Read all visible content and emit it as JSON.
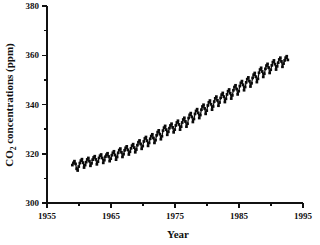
{
  "chart_data": {
    "type": "line",
    "title": "",
    "xlabel": "Year",
    "ylabel": "CO2 concentrations (ppm)",
    "ylabel_display": "CO₂ concentrations (ppm)",
    "xlim": [
      1955,
      1995
    ],
    "ylim": [
      300,
      380
    ],
    "grid": false,
    "legend": "none",
    "xticks": [
      1955,
      1965,
      1975,
      1985,
      1995
    ],
    "xticks_minor": [
      1960,
      1970,
      1980,
      1990
    ],
    "xtick_labels": [
      "1955",
      "1965",
      "1975",
      "1985",
      "1995"
    ],
    "yticks": [
      300,
      320,
      340,
      360,
      380
    ],
    "yticks_minor": [
      310,
      330,
      350,
      370
    ],
    "ytick_labels": [
      "300",
      "320",
      "340",
      "360",
      "380"
    ],
    "marker": "filled-square",
    "series": [
      {
        "name": "Mauna Loa monthly mean CO2",
        "x": [
          1958.96,
          1959.13,
          1959.29,
          1959.46,
          1959.63,
          1959.79,
          1959.96,
          1960.13,
          1960.29,
          1960.46,
          1960.63,
          1960.79,
          1960.96,
          1961.13,
          1961.29,
          1961.46,
          1961.63,
          1961.79,
          1961.96,
          1962.13,
          1962.29,
          1962.46,
          1962.63,
          1962.79,
          1962.96,
          1963.13,
          1963.29,
          1963.46,
          1963.63,
          1963.79,
          1963.96,
          1964.13,
          1964.29,
          1964.46,
          1964.63,
          1964.79,
          1964.96,
          1965.13,
          1965.29,
          1965.46,
          1965.63,
          1965.79,
          1965.96,
          1966.13,
          1966.29,
          1966.46,
          1966.63,
          1966.79,
          1966.96,
          1967.13,
          1967.29,
          1967.46,
          1967.63,
          1967.79,
          1967.96,
          1968.13,
          1968.29,
          1968.46,
          1968.63,
          1968.79,
          1968.96,
          1969.13,
          1969.29,
          1969.46,
          1969.63,
          1969.79,
          1969.96,
          1970.13,
          1970.29,
          1970.46,
          1970.63,
          1970.79,
          1970.96,
          1971.13,
          1971.29,
          1971.46,
          1971.63,
          1971.79,
          1971.96,
          1972.13,
          1972.29,
          1972.46,
          1972.63,
          1972.79,
          1972.96,
          1973.13,
          1973.29,
          1973.46,
          1973.63,
          1973.79,
          1973.96,
          1974.13,
          1974.29,
          1974.46,
          1974.63,
          1974.79,
          1974.96,
          1975.13,
          1975.29,
          1975.46,
          1975.63,
          1975.79,
          1975.96,
          1976.13,
          1976.29,
          1976.46,
          1976.63,
          1976.79,
          1976.96,
          1977.13,
          1977.29,
          1977.46,
          1977.63,
          1977.79,
          1977.96,
          1978.13,
          1978.29,
          1978.46,
          1978.63,
          1978.79,
          1978.96,
          1979.13,
          1979.29,
          1979.46,
          1979.63,
          1979.79,
          1979.96,
          1980.13,
          1980.29,
          1980.46,
          1980.63,
          1980.79,
          1980.96,
          1981.13,
          1981.29,
          1981.46,
          1981.63,
          1981.79,
          1981.96,
          1982.13,
          1982.29,
          1982.46,
          1982.63,
          1982.79,
          1982.96,
          1983.13,
          1983.29,
          1983.46,
          1983.63,
          1983.79,
          1983.96,
          1984.13,
          1984.29,
          1984.46,
          1984.63,
          1984.79,
          1984.96,
          1985.13,
          1985.29,
          1985.46,
          1985.63,
          1985.79,
          1985.96,
          1986.13,
          1986.29,
          1986.46,
          1986.63,
          1986.79,
          1986.96,
          1987.13,
          1987.29,
          1987.46,
          1987.63,
          1987.79,
          1987.96,
          1988.13,
          1988.29,
          1988.46,
          1988.63,
          1988.79,
          1988.96,
          1989.13,
          1989.29,
          1989.46,
          1989.63,
          1989.79,
          1989.96,
          1990.13,
          1990.29,
          1990.46,
          1990.63,
          1990.79,
          1990.96,
          1991.13,
          1991.29,
          1991.46,
          1991.63,
          1991.79,
          1991.96,
          1992.13,
          1992.29,
          1992.46,
          1992.63
        ],
        "y": [
          315.4,
          316.3,
          317.0,
          315.9,
          313.9,
          313.2,
          314.8,
          316.2,
          317.2,
          317.8,
          316.4,
          314.4,
          315.4,
          316.6,
          317.7,
          318.3,
          317.0,
          315.1,
          316.1,
          317.6,
          318.5,
          319.0,
          317.7,
          315.7,
          316.8,
          318.3,
          319.2,
          319.7,
          318.3,
          316.3,
          317.4,
          318.8,
          319.6,
          320.2,
          318.9,
          317.0,
          318.0,
          319.4,
          320.4,
          321.0,
          319.5,
          317.6,
          318.7,
          320.4,
          321.5,
          322.1,
          320.6,
          318.7,
          319.8,
          321.4,
          322.4,
          323.0,
          321.6,
          319.7,
          320.8,
          322.2,
          323.3,
          323.9,
          322.5,
          320.6,
          321.7,
          323.5,
          324.7,
          325.4,
          324.0,
          322.0,
          323.1,
          325.0,
          326.2,
          326.8,
          325.3,
          323.2,
          324.4,
          326.1,
          327.2,
          327.9,
          326.4,
          324.4,
          325.5,
          327.5,
          328.8,
          329.5,
          328.0,
          325.9,
          327.1,
          329.4,
          330.6,
          331.3,
          329.8,
          327.7,
          328.9,
          330.4,
          331.5,
          332.2,
          330.7,
          328.7,
          329.8,
          331.5,
          332.7,
          333.4,
          331.9,
          329.8,
          331.0,
          332.7,
          333.9,
          334.6,
          333.1,
          331.0,
          332.2,
          334.5,
          335.8,
          336.5,
          335.0,
          332.9,
          334.1,
          336.2,
          337.4,
          338.1,
          336.6,
          334.5,
          335.7,
          337.9,
          339.2,
          339.9,
          338.4,
          336.2,
          337.5,
          339.6,
          340.9,
          341.6,
          340.1,
          337.9,
          339.2,
          341.2,
          342.5,
          343.2,
          341.7,
          339.5,
          340.8,
          342.7,
          344.0,
          344.7,
          343.2,
          341.0,
          342.3,
          344.1,
          345.4,
          346.1,
          344.6,
          342.4,
          343.7,
          345.8,
          347.1,
          347.8,
          346.3,
          344.1,
          345.4,
          347.5,
          348.8,
          349.5,
          348.0,
          345.8,
          347.1,
          349.0,
          350.3,
          351.0,
          349.5,
          347.3,
          348.6,
          350.8,
          352.1,
          352.8,
          351.3,
          349.1,
          350.4,
          352.9,
          354.2,
          354.9,
          353.4,
          351.2,
          352.5,
          354.5,
          355.8,
          356.5,
          355.0,
          352.8,
          354.1,
          355.9,
          357.2,
          357.9,
          356.4,
          354.2,
          355.5,
          357.0,
          358.3,
          359.0,
          357.5,
          355.3,
          356.6,
          357.9,
          359.0,
          359.6,
          358.1
        ]
      }
    ]
  }
}
